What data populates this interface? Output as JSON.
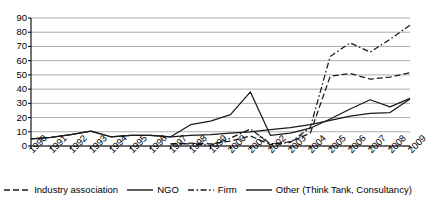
{
  "chart_data": {
    "type": "line",
    "title": "",
    "subtitle": "",
    "xlabel": "",
    "ylabel": "",
    "grid": true,
    "legend_position": "bottom",
    "ylim": [
      0,
      90
    ],
    "yticks": [
      0,
      10,
      20,
      30,
      40,
      50,
      60,
      70,
      80,
      90
    ],
    "categories": [
      "1990",
      "1991",
      "1992",
      "1993",
      "1994",
      "1995",
      "1996",
      "1997",
      "1998",
      "1999",
      "2000",
      "2001",
      "2002",
      "2003",
      "2004",
      "2005",
      "2006",
      "2007",
      "2008",
      "2009"
    ],
    "series": [
      {
        "name": "Industry association",
        "style": "dashed",
        "color": "#1a1a1a",
        "values": [
          null,
          null,
          null,
          null,
          null,
          null,
          null,
          1.5,
          2,
          1.5,
          3.5,
          7,
          1,
          3,
          9,
          49,
          51,
          47,
          48.5,
          51.5
        ]
      },
      {
        "name": "NGO",
        "style": "solid",
        "color": "#1a1a1a",
        "values": [
          5,
          6,
          8,
          10.5,
          6.5,
          7.5,
          7.5,
          6.5,
          7.5,
          8,
          9,
          10,
          11.5,
          13,
          15,
          18,
          21,
          23,
          23.5,
          33
        ]
      },
      {
        "name": "Firm",
        "style": "dash-dot",
        "color": "#1a1a1a",
        "values": [
          null,
          null,
          null,
          null,
          null,
          null,
          null,
          1.5,
          1.5,
          0.5,
          5.5,
          12,
          1.5,
          2.5,
          13,
          63,
          72.5,
          66,
          75,
          85
        ]
      },
      {
        "name": "Other (Think Tank, Consultancy)",
        "style": "solid",
        "color": "#1a1a1a",
        "values": [
          5,
          6,
          8,
          10.5,
          6.5,
          7.5,
          7.5,
          6.5,
          15,
          17.5,
          22,
          38,
          7.5,
          9,
          12.5,
          19,
          26,
          32.5,
          27.5,
          33.5
        ]
      }
    ]
  },
  "legend": {
    "items": [
      {
        "label": "Industry association",
        "swatch": "dashed-line-icon"
      },
      {
        "label": "NGO",
        "swatch": "solid-line-icon"
      },
      {
        "label": "Firm",
        "swatch": "dash-dot-line-icon"
      },
      {
        "label": "Other (Think Tank, Consultancy)",
        "swatch": "solid-line-icon"
      }
    ]
  }
}
